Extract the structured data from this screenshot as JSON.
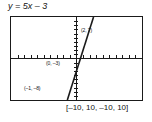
{
  "title": "y = 5x – 3",
  "window_caption": "[–10, 10, –10, 10]",
  "labels": {
    "point_1": "(2, 7)",
    "point_2": "(0, –3)",
    "point_3": "(–1, –8)"
  },
  "colors": {
    "line": "#1a1a1a",
    "axis": "#1a1a1a",
    "frame": "#1a1a1a",
    "background": "#ffffff",
    "text": "#111111"
  },
  "chart_data": {
    "type": "line",
    "title": "y = 5x – 3",
    "xlabel": "",
    "ylabel": "",
    "xlim": [
      -10,
      10
    ],
    "ylim": [
      -10,
      10
    ],
    "xtick_step": 1,
    "ytick_step": 1,
    "grid": false,
    "legend": false,
    "equation": "y = 5x – 3",
    "slope": 5,
    "y_intercept": -3,
    "series": [
      {
        "name": "y = 5x – 3",
        "x": [
          -1.4,
          2.6
        ],
        "y": [
          -10,
          10
        ]
      }
    ],
    "annotations": [
      {
        "label": "(2, 7)",
        "x": 2,
        "y": 7
      },
      {
        "label": "(0, –3)",
        "x": 0,
        "y": -3
      },
      {
        "label": "(–1, –8)",
        "x": -1,
        "y": -8
      }
    ],
    "window_caption": "[–10, 10, –10, 10]"
  }
}
